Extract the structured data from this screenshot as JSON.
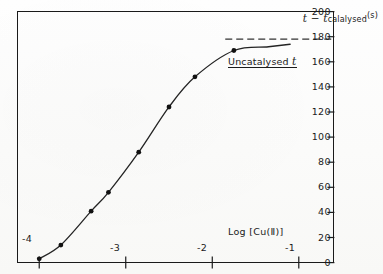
{
  "chart_data": {
    "type": "line",
    "title": "",
    "xlabel": "Log  [Cu(Ⅱ)]",
    "ylabel": "t − t catalysed (s)",
    "ylabel_parts": {
      "main": "t − t",
      "subscript": "calalysed",
      "unit": "(s)"
    },
    "xlim": [
      -4.25,
      -0.6
    ],
    "ylim": [
      0,
      200
    ],
    "xticks": [
      -4,
      -3,
      -2,
      -1
    ],
    "xtick_labels": [
      "-4",
      "-3",
      "-2",
      "-1"
    ],
    "yticks": [
      0,
      20,
      40,
      60,
      80,
      100,
      120,
      140,
      160,
      180,
      200
    ],
    "ytick_labels": [
      "0",
      "20",
      "40",
      "60",
      "80",
      "100",
      "120",
      "140",
      "160",
      "180",
      "200"
    ],
    "grid": false,
    "legend": "none",
    "y_axis_side": "right",
    "series": [
      {
        "name": "catalysed time difference",
        "marker": "filled-circle",
        "x": [
          -4.0,
          -3.75,
          -3.4,
          -3.2,
          -2.85,
          -2.5,
          -2.2,
          -1.75
        ],
        "values": [
          3,
          14,
          41,
          56,
          88,
          124,
          148,
          169
        ]
      }
    ],
    "annotations": [
      {
        "name": "uncatalysed-reference",
        "text": "Uncatalysed t",
        "style": "dashed-horizontal-line",
        "y": 178
      }
    ]
  },
  "axes": {
    "y_label_main": "t − t",
    "y_label_sub": "calalysed",
    "y_label_unit": "(s)",
    "x_label": "Log  [Cu(Ⅱ)]"
  },
  "annotation": {
    "uncatalysed_label": "Uncatalysed t",
    "uncatalysed_italic": "t",
    "uncatalysed_word": "Uncatalysed"
  },
  "colors": {
    "ink": "#1b1b1b",
    "curve": "#242424",
    "marker": "#111111",
    "paper": "#fdfdfc",
    "dash": "#333333"
  }
}
